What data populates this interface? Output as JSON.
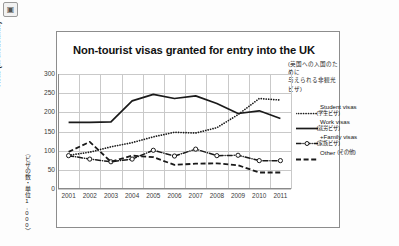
{
  "corner": {
    "icon": "thumbnail-icon",
    "glyph": "▣"
  },
  "slide": {
    "title": "Non-tourist visas granted for entry into the UK",
    "subtitle_jp_line1": "(英国への入国のために",
    "subtitle_jp_line2": "与えられる非観光ビザ)"
  },
  "axes": {
    "y_label": "Visas (in thousands)",
    "y_label_jp": "〈ビザの数・単位1,000〉",
    "y_ticks": [
      "300",
      "250",
      "200",
      "150",
      "100",
      "50",
      "0"
    ],
    "x_ticks": [
      "2001",
      "2002",
      "2003",
      "2004",
      "2005",
      "2006",
      "2007",
      "2008",
      "2009",
      "2010",
      "2011"
    ]
  },
  "legend": {
    "items": [
      {
        "label": "Student visas",
        "label_jp": "(学生ビザ)",
        "style": "dotted",
        "marker": "none",
        "color": "#1a1a1a"
      },
      {
        "label": "Work visas",
        "label_jp": "(就労ビザ)",
        "style": "solid",
        "marker": "none",
        "color": "#1a1a1a"
      },
      {
        "label": "Family visas",
        "label_jp": "(家族ビザ)",
        "style": "dashdot",
        "marker": "circle",
        "color": "#1a1a1a"
      },
      {
        "label": "Other",
        "label_jp": "(その他)",
        "style": "dashed",
        "marker": "none",
        "color": "#1a1a1a"
      }
    ],
    "family_prefix": "+"
  },
  "chart_data": {
    "type": "line",
    "title": "Non-tourist visas granted for entry into the UK",
    "subtitle": "(英国への入国のために与えられる非観光ビザ)",
    "xlabel": "",
    "ylabel": "Visas (in thousands)",
    "ylabel_jp": "〈ビザの数・単位1,000〉",
    "x": [
      "2001",
      "2002",
      "2003",
      "2004",
      "2005",
      "2006",
      "2007",
      "2008",
      "2009",
      "2010",
      "2011"
    ],
    "ylim": [
      0,
      300
    ],
    "ytick_step": 50,
    "grid": true,
    "legend_position": "right",
    "series": [
      {
        "name": "Student visas",
        "name_jp": "(学生ビザ)",
        "style": "dotted",
        "values": [
          88,
          96,
          110,
          121,
          136,
          148,
          146,
          160,
          194,
          236,
          232
        ]
      },
      {
        "name": "Work visas",
        "name_jp": "(就労ビザ)",
        "style": "solid",
        "values": [
          174,
          174,
          175,
          230,
          247,
          236,
          243,
          223,
          197,
          204,
          184
        ]
      },
      {
        "name": "Family visas",
        "name_jp": "(家族ビザ)",
        "style": "dashdot",
        "marker": "circle",
        "values": [
          87,
          78,
          71,
          78,
          101,
          86,
          104,
          87,
          88,
          74,
          74
        ]
      },
      {
        "name": "Other",
        "name_jp": "(その他)",
        "style": "dashed",
        "values": [
          97,
          123,
          71,
          87,
          83,
          63,
          66,
          67,
          62,
          43,
          43
        ]
      }
    ]
  }
}
